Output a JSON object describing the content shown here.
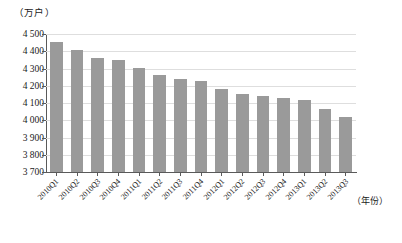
{
  "chart_data": {
    "type": "bar",
    "title": "",
    "subtitle": "",
    "xlabel": "（年份）",
    "ylabel": "（万户）",
    "ylim": [
      3700,
      4500
    ],
    "ytick_step": 100,
    "yticks": [
      "4 500",
      "4 400",
      "4 300",
      "4 200",
      "4 100",
      "4 000",
      "3 900",
      "3 800",
      "3 700"
    ],
    "ytick_values": [
      4500,
      4400,
      4300,
      4200,
      4100,
      4000,
      3900,
      3800,
      3700
    ],
    "grid": true,
    "legend": false,
    "legend_position": "none",
    "bar_color": "#9a9a9a",
    "categories": [
      "2010Q1",
      "2010Q2",
      "2010Q3",
      "2010Q4",
      "2011Q1",
      "2011Q2",
      "2011Q3",
      "2011Q4",
      "2012Q1",
      "2012Q2",
      "2012Q3",
      "2012Q4",
      "2013Q1",
      "2013Q2",
      "2013Q3"
    ],
    "values": [
      4452,
      4410,
      4360,
      4352,
      4303,
      4262,
      4240,
      4228,
      4180,
      4152,
      4140,
      4130,
      4115,
      4065,
      4020
    ]
  },
  "axes": {
    "y_unit_caption": "（万户）",
    "x_unit_caption": "（年份）"
  }
}
